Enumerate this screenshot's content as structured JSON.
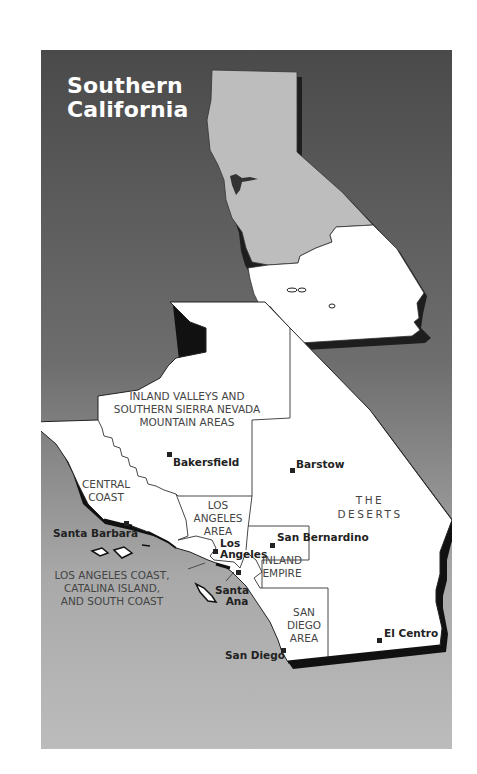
{
  "map": {
    "title_line1": "Southern",
    "title_line2": "California",
    "colors": {
      "background_top": "#4a4a4a",
      "background_bottom": "#b9b9b9",
      "northern_california": "#bdbdbd",
      "southern_california": "#ffffff",
      "outline": "#222222",
      "shadow": "#1a1a1a"
    },
    "regions": {
      "inland_valleys": [
        "INLAND VALLEYS AND",
        "SOUTHERN SIERRA NEVADA",
        "MOUNTAIN AREAS"
      ],
      "central_coast": [
        "CENTRAL",
        "COAST"
      ],
      "los_angeles_area": [
        "LOS",
        "ANGELES",
        "AREA"
      ],
      "the_deserts": [
        "THE",
        "DESERTS"
      ],
      "inland_empire": [
        "INLAND",
        "EMPIRE"
      ],
      "san_diego_area": [
        "SAN",
        "DIEGO",
        "AREA"
      ],
      "la_coast": [
        "LOS ANGELES COAST,",
        "CATALINA ISLAND,",
        "AND SOUTH COAST"
      ]
    },
    "cities": {
      "bakersfield": "Bakersfield",
      "barstow": "Barstow",
      "santa_barbara": "Santa Barbara",
      "los_angeles_1": "Los",
      "los_angeles_2": "Angeles",
      "san_bernardino": "San Bernardino",
      "santa_ana_1": "Santa",
      "santa_ana_2": "Ana",
      "san_diego": "San Diego",
      "el_centro": "El Centro"
    }
  }
}
